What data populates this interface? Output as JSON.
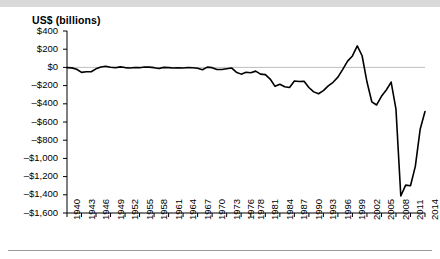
{
  "figure": {
    "y_axis_title": "US$ (billions)",
    "top_band_color": "#d9d9d9",
    "line_color": "#000000",
    "zero_line_color": "#bfbfbf",
    "axis_color": "#000000",
    "background": "#ffffff"
  },
  "chart_data": {
    "type": "line",
    "title": "",
    "subtitle": "",
    "xlabel": "",
    "ylabel": "US$ (billions)",
    "legend": [],
    "legend_position": "none",
    "grid": false,
    "zero_reference_line": true,
    "xlim": [
      1940,
      2014
    ],
    "ylim": [
      -1600,
      400
    ],
    "ytick_step": 200,
    "ytick_labels": [
      "$400",
      "$200",
      "$0",
      "–$200",
      "–$400",
      "–$600",
      "–$800",
      "–$1,000",
      "–$1,200",
      "–$1,400",
      "–$1,600"
    ],
    "ytick_values": [
      400,
      200,
      0,
      -200,
      -400,
      -600,
      -800,
      -1000,
      -1200,
      -1400,
      -1600
    ],
    "xtick_labels": [
      "1940",
      "1943",
      "1946",
      "1949",
      "1952",
      "1955",
      "1958",
      "1961",
      "1964",
      "1967",
      "1970",
      "1973",
      "1976",
      "1978",
      "1981",
      "1984",
      "1987",
      "1990",
      "1993",
      "1996",
      "1999",
      "2002",
      "2005",
      "2008",
      "2011",
      "2014"
    ],
    "xtick_values": [
      1940,
      1943,
      1946,
      1949,
      1952,
      1955,
      1958,
      1961,
      1964,
      1967,
      1970,
      1973,
      1976,
      1978,
      1981,
      1984,
      1987,
      1990,
      1993,
      1996,
      1999,
      2002,
      2005,
      2008,
      2011,
      2014
    ],
    "series": [
      {
        "name": "Federal surplus or deficit",
        "x": [
          1940,
          1941,
          1942,
          1943,
          1944,
          1945,
          1946,
          1947,
          1948,
          1949,
          1950,
          1951,
          1952,
          1953,
          1954,
          1955,
          1956,
          1957,
          1958,
          1959,
          1960,
          1961,
          1962,
          1963,
          1964,
          1965,
          1966,
          1967,
          1968,
          1969,
          1970,
          1971,
          1972,
          1973,
          1974,
          1975,
          1976,
          1977,
          1978,
          1979,
          1980,
          1981,
          1982,
          1983,
          1984,
          1985,
          1986,
          1987,
          1988,
          1989,
          1990,
          1991,
          1992,
          1993,
          1994,
          1995,
          1996,
          1997,
          1998,
          1999,
          2000,
          2001,
          2002,
          2003,
          2004,
          2005,
          2006,
          2007,
          2008,
          2009,
          2010,
          2011,
          2012,
          2013,
          2014
        ],
        "values": [
          -3,
          -5,
          -20,
          -55,
          -48,
          -48,
          -16,
          4,
          12,
          1,
          -3,
          6,
          -2,
          -6,
          -1,
          -3,
          4,
          3,
          -3,
          -13,
          0,
          -3,
          -7,
          -5,
          -6,
          -1,
          -4,
          -9,
          -25,
          3,
          -3,
          -23,
          -23,
          -15,
          -6,
          -53,
          -74,
          -54,
          -59,
          -41,
          -74,
          -79,
          -128,
          -208,
          -185,
          -212,
          -221,
          -150,
          -155,
          -152,
          -221,
          -269,
          -290,
          -255,
          -203,
          -164,
          -107,
          -22,
          69,
          126,
          236,
          128,
          -158,
          -378,
          -413,
          -318,
          -248,
          -161,
          -459,
          -1413,
          -1294,
          -1300,
          -1087,
          -680,
          -485
        ]
      }
    ]
  }
}
